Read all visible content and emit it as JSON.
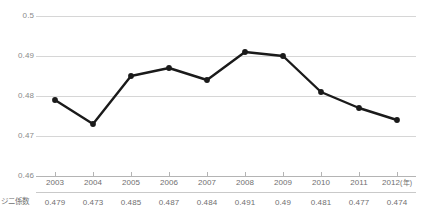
{
  "chart_data": {
    "type": "line",
    "title": "",
    "xlabel": "(年)",
    "ylabel": "",
    "categories": [
      "2003",
      "2004",
      "2005",
      "2006",
      "2007",
      "2008",
      "2009",
      "2010",
      "2011",
      "2012"
    ],
    "values": [
      0.479,
      0.473,
      0.485,
      0.487,
      0.484,
      0.491,
      0.49,
      0.481,
      0.477,
      0.474
    ],
    "series": [
      {
        "name": "ジニ係数",
        "values": [
          0.479,
          0.473,
          0.485,
          0.487,
          0.484,
          0.491,
          0.49,
          0.481,
          0.477,
          0.474
        ]
      }
    ],
    "ylim": [
      0.46,
      0.5
    ],
    "yticks": [
      "0.46",
      "0.47",
      "0.48",
      "0.49",
      "0.5"
    ],
    "ytick_values": [
      0.46,
      0.47,
      0.48,
      0.49,
      0.5
    ],
    "grid": true,
    "legend": "none",
    "line_color": "#1a1a1a",
    "marker_color": "#1a1a1a",
    "gridline_color": "#d6d6d6",
    "text_color": "#6f6f6f"
  },
  "axis": {
    "x_unit_label": "(年)"
  },
  "table": {
    "row_label": "ジニ係数",
    "headers": [
      "2003",
      "2004",
      "2005",
      "2006",
      "2007",
      "2008",
      "2009",
      "2010",
      "2011",
      "2012"
    ],
    "values": [
      "0.479",
      "0.473",
      "0.485",
      "0.487",
      "0.484",
      "0.491",
      "0.49",
      "0.481",
      "0.477",
      "0.474"
    ]
  }
}
